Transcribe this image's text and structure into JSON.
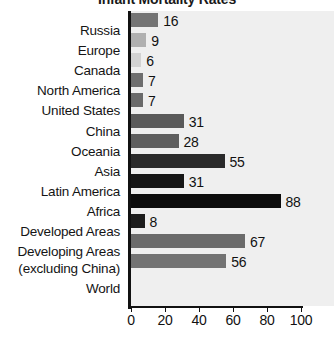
{
  "chart_data": {
    "type": "bar",
    "orientation": "horizontal",
    "title": "Infant Mortality Rates",
    "xlabel": "",
    "ylabel": "",
    "xlim": [
      0,
      100
    ],
    "xticks": [
      0,
      20,
      40,
      60,
      80,
      100
    ],
    "grid": false,
    "legend": "none",
    "categories": [
      "Russia",
      "Europe",
      "Canada",
      "North America",
      "United States",
      "China",
      "Oceania",
      "Asia",
      "Latin America",
      "Africa",
      "Developed Areas",
      "Developing Areas (excluding China)",
      "World"
    ],
    "category_label_lines": [
      [
        "Russia"
      ],
      [
        "Europe"
      ],
      [
        "Canada"
      ],
      [
        "North America"
      ],
      [
        "United States"
      ],
      [
        "China"
      ],
      [
        "Oceania"
      ],
      [
        "Asia"
      ],
      [
        "Latin America"
      ],
      [
        "Africa"
      ],
      [
        "Developed Areas"
      ],
      [
        "Developing Areas",
        "(excluding China)"
      ],
      [
        "World"
      ]
    ],
    "values": [
      16,
      9,
      6,
      7,
      7,
      31,
      28,
      55,
      31,
      88,
      8,
      67,
      56
    ],
    "value_labels": [
      "16",
      "9",
      "6",
      "7",
      "7",
      "31",
      "28",
      "55",
      "31",
      "88",
      "8",
      "67",
      "56"
    ],
    "bar_colors": [
      "#747474",
      "#b0b0b0",
      "#d2d2d2",
      "#6e6e6e",
      "#6a6a6a",
      "#5a5a5a",
      "#5e5e5e",
      "#2a2a2a",
      "#161616",
      "#0d0d0d",
      "#1d1d1d",
      "#6b6b6b",
      "#737373"
    ],
    "plot_background": "#efefef",
    "axis_color": "#111111",
    "text_color": "#141414"
  }
}
